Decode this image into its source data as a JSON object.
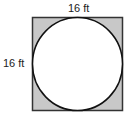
{
  "diagram": {
    "type": "circle-inscribed-in-square",
    "top_label": "16 ft",
    "side_label": "16 ft",
    "colors": {
      "shaded_region": "#c8c8c8",
      "outline": "#333333",
      "circle_fill": "#ffffff"
    }
  }
}
